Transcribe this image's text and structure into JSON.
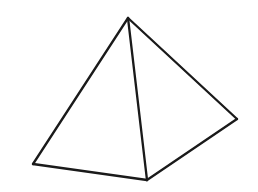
{
  "image": {
    "title": "Pyramid wireframe line drawing",
    "width": 258,
    "height": 192,
    "background_color": "#ffffff",
    "stroke_color": "#1a1a1a",
    "stroke_width": 2.3,
    "subject": "square pyramid",
    "style": "black outline wireframe, no fill, no labels, no text"
  },
  "figure": {
    "name": "square-pyramid",
    "projection": "oblique three-quarter view",
    "vertices": {
      "apex": {
        "label": "apex",
        "x": 128,
        "y": 18
      },
      "base_left": {
        "label": "base-left",
        "x": 33,
        "y": 164
      },
      "base_front": {
        "label": "base-front",
        "x": 147,
        "y": 180
      },
      "base_right": {
        "label": "base-right",
        "x": 237,
        "y": 119
      },
      "base_back": {
        "label": "base-back-hidden",
        "x": 123,
        "y": 103
      }
    },
    "edges": [
      {
        "name": "apex-to-base-left",
        "from": "apex",
        "to": "base_left",
        "visible": true,
        "path": "M128,18 L33,164"
      },
      {
        "name": "apex-to-base-front",
        "from": "apex",
        "to": "base_front",
        "visible": true,
        "path": "M128,18 L147,180"
      },
      {
        "name": "apex-to-base-right",
        "from": "apex",
        "to": "base_right",
        "visible": true,
        "path": "M128,18 L237,119"
      },
      {
        "name": "base-left-to-base-front",
        "from": "base_left",
        "to": "base_front",
        "visible": true,
        "path": "M33,164 L147,180"
      },
      {
        "name": "base-front-to-base-right",
        "from": "base_front",
        "to": "base_right",
        "visible": true,
        "path": "M147,180 L237,119"
      }
    ],
    "faces": [
      {
        "name": "left-face",
        "fill": "#ffffff",
        "points": "128,18 33,164 147,180"
      },
      {
        "name": "right-face",
        "fill": "#ffffff",
        "points": "128,18 147,180 237,119"
      }
    ]
  }
}
